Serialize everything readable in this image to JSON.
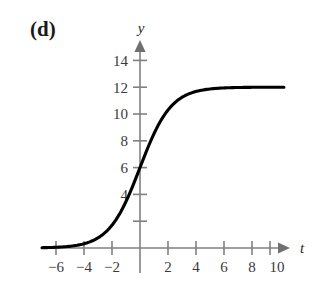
{
  "panel": {
    "label": "(d)"
  },
  "axes": {
    "x_name": "t",
    "y_name": "y",
    "x_ticks_labeled": [
      "−6",
      "−4",
      "−2",
      "2",
      "4",
      "6",
      "8",
      "10"
    ],
    "y_ticks_labeled": [
      "14",
      "12",
      "10",
      "8",
      "6",
      "4"
    ]
  },
  "chart_data": {
    "type": "line",
    "title": "",
    "xlabel": "t",
    "ylabel": "y",
    "xlim": [
      -8,
      11.5
    ],
    "ylim": [
      -1.5,
      15.5
    ],
    "grid": false,
    "legend": null,
    "x_ticks": [
      -6,
      -4,
      -2,
      2,
      4,
      6,
      8,
      10
    ],
    "x_tick_labels": [
      "−6",
      "−4",
      "−2",
      "2",
      "4",
      "6",
      "8",
      "10"
    ],
    "y_ticks": [
      2,
      4,
      6,
      8,
      10,
      12,
      14
    ],
    "y_tick_labels": [
      "",
      "4",
      "6",
      "8",
      "10",
      "12",
      "14"
    ],
    "series": [
      {
        "name": "logistic",
        "equation": "y = 12 / (1 + e^(-0.9 t))",
        "asymptote_upper": 12,
        "asymptote_lower": 0,
        "y_intercept": 6,
        "x": [
          -8,
          -7,
          -6,
          -5,
          -4,
          -3,
          -2,
          -1.5,
          -1,
          -0.5,
          0,
          0.5,
          1,
          1.5,
          2,
          2.5,
          3,
          4,
          5,
          6,
          7,
          8,
          9,
          10,
          11
        ],
        "values": [
          0.01,
          0.02,
          0.05,
          0.13,
          0.32,
          0.79,
          1.89,
          2.84,
          4.14,
          5.06,
          6.0,
          6.94,
          7.86,
          9.16,
          10.11,
          10.87,
          11.21,
          11.67,
          11.87,
          11.95,
          11.98,
          11.99,
          12.0,
          12.0,
          12.0
        ]
      }
    ]
  },
  "colors": {
    "axis": "#808080",
    "curve": "#000000",
    "text": "#2a2a2a",
    "background": "#ffffff"
  }
}
